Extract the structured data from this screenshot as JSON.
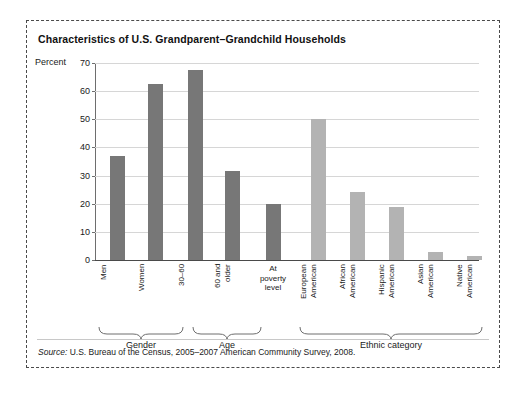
{
  "figure": {
    "title": "Characteristics of U.S. Grandparent–Grandchild Households",
    "axis_label": "Percent",
    "source_prefix": "Source:",
    "source_text": " U.S. Bureau of the Census, 2005–2007 American Community Survey, 2008."
  },
  "chart_data": {
    "type": "bar",
    "title": "Characteristics of U.S. Grandparent–Grandchild Households",
    "xlabel": "",
    "ylabel": "Percent",
    "ylim": [
      0,
      70
    ],
    "yticks": [
      "0",
      "10",
      "20",
      "30",
      "40",
      "50",
      "60",
      "70"
    ],
    "grid": true,
    "legend": "none",
    "categories": [
      "Men",
      "Women",
      "30–60",
      "60 and older",
      "At poverty level",
      "European American",
      "African American",
      "Hispanic American",
      "Asian American",
      "Native American"
    ],
    "values": [
      37,
      62.5,
      67.5,
      31.5,
      20,
      50,
      24,
      19,
      3,
      1.5
    ],
    "bar_colors": [
      "#777777",
      "#777777",
      "#777777",
      "#777777",
      "#777777",
      "#b3b3b3",
      "#b3b3b3",
      "#b3b3b3",
      "#b3b3b3",
      "#b3b3b3"
    ],
    "groups": [
      {
        "name": "Gender",
        "from": 0,
        "to": 1
      },
      {
        "name": "Age",
        "from": 2,
        "to": 3
      },
      {
        "name": "Ethnic category",
        "from": 5,
        "to": 9
      }
    ],
    "colors": {
      "dark_bar": "#777777",
      "light_bar": "#b3b3b3",
      "gridline": "#d6d6d6",
      "axis": "#4a4a4a",
      "border": "#4a4a4a"
    }
  },
  "labels": {
    "men": "Men",
    "women": "Women",
    "age_30_60": "30–60",
    "age_60_older_line1": "60 and",
    "age_60_older_line2": "older",
    "poverty_line1": "At",
    "poverty_line2": "poverty",
    "poverty_line3": "level",
    "european_line1": "European",
    "european_line2": "American",
    "african_line1": "African",
    "african_line2": "American",
    "hispanic_line1": "Hispanic",
    "hispanic_line2": "American",
    "asian_line1": "Asian",
    "asian_line2": "American",
    "native_line1": "Native",
    "native_line2": "American",
    "group_gender": "Gender",
    "group_age": "Age",
    "group_ethnic": "Ethnic category"
  }
}
